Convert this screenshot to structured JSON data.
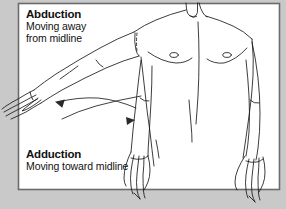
{
  "figure": {
    "name": "arm-abduction-adduction-diagram",
    "background_color": "#c9c9c9",
    "panel_color": "#ffffff",
    "panel_border_color": "#6b6b6b",
    "ink_color": "#1a1a1a"
  },
  "labels": {
    "abduction": {
      "title": "Abduction",
      "line1": "Moving away",
      "line2": "from midline"
    },
    "adduction": {
      "title": "Adduction",
      "line1": "Moving toward midline",
      "line2": ""
    }
  },
  "arrows": [
    {
      "name": "abduction-arrow",
      "direction": "leftward-outward",
      "meaning": "away from midline"
    },
    {
      "name": "adduction-arrow",
      "direction": "rightward-inward",
      "meaning": "toward midline"
    }
  ]
}
